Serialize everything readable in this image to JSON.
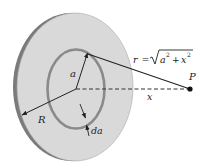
{
  "figure": {
    "colors": {
      "background": "#ffffff",
      "disk_face": "#d9d9d9",
      "disk_rim": "#7b7b7b",
      "disk_outline": "#9a9a9a",
      "ring": "#8a8a8a",
      "lines": "#222222",
      "point": "#111111"
    },
    "labels": {
      "r_prefix": "r =",
      "r_radicand_a": "a",
      "r_radicand_exp1": "2",
      "r_radicand_plus": "+",
      "r_radicand_x": "x",
      "r_radicand_exp2": "2",
      "point": "P",
      "axis_distance": "x",
      "ring_radius": "a",
      "disk_radius": "R",
      "ring_width": "da"
    },
    "geometry": {
      "disk_center": [
        75,
        89
      ],
      "disk_rx": 58,
      "disk_ry": 74,
      "ring_rx": 29,
      "ring_ry": 40,
      "point_P": [
        190,
        89
      ]
    }
  }
}
